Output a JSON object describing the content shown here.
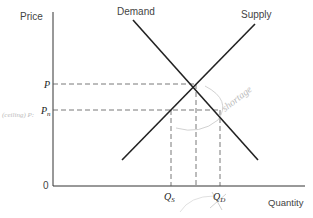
{
  "diagram": {
    "type": "supply-demand",
    "axes": {
      "y_label": "Price",
      "x_label": "Quantity",
      "origin_label": "0"
    },
    "curves": {
      "demand_label": "Demand",
      "supply_label": "Supply"
    },
    "price_levels": {
      "equilibrium_label": "P",
      "ceiling_label": "P",
      "ceiling_subscript": "n"
    },
    "quantity_levels": {
      "qs_label": "Q",
      "qs_subscript": "S",
      "qd_label": "Q",
      "qd_subscript": "D"
    },
    "annotations": {
      "shortage_handwritten": "shortage",
      "left_handwritten": "(ceiling) P:"
    },
    "colors": {
      "curve": "#222222",
      "axis": "#333333",
      "dashed": "#555555",
      "handwriting": "#bbbbbb"
    }
  }
}
